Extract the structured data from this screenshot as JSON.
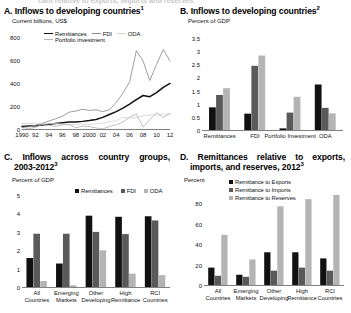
{
  "figure": {
    "cut_off_header": "cant relative to exports, imports and reserves"
  },
  "panels": {
    "a": {
      "title": "A. Inflows to developing countries",
      "title_sup": "1",
      "axis_label": "Current billions, US$",
      "legend": [
        "Remittances",
        "FDI",
        "ODA",
        "Portfolio investment"
      ],
      "yticks": [
        "0",
        "200",
        "400",
        "600",
        "800"
      ],
      "xticks": [
        "1990",
        "92",
        "94",
        "96",
        "98",
        "2000",
        "02",
        "04",
        "06",
        "08",
        "10",
        "12"
      ]
    },
    "b": {
      "title": "B. Inflows to developing countries",
      "title_sup": "2",
      "axis_label": "Percent of GDP",
      "legend": [
        "1990",
        "2000",
        "2010"
      ],
      "yticks": [
        "0",
        "0.5",
        "1",
        "1.5",
        "2",
        "2.5",
        "3",
        "3.5"
      ],
      "categories": [
        "Remittances",
        "FDI",
        "Portfolio Investment",
        "ODA"
      ]
    },
    "c": {
      "title": "C. Inflows across country groups,",
      "title_line2": "2003-2012",
      "title_sup": "3",
      "axis_label": "Percent of GDP",
      "legend": [
        "Remittances",
        "FDI",
        "ODA"
      ],
      "yticks": [
        "0",
        "1",
        "2",
        "3",
        "4",
        "5"
      ],
      "categories": [
        "All Countries",
        "Emerging Markets",
        "Other Developing",
        "High Remittance",
        "RCI Countries"
      ]
    },
    "d": {
      "title": "D. Remittances relative to exports,",
      "title_line2": "imports, and reserves, 2012",
      "title_sup": "3",
      "axis_label": "Percent",
      "legend": [
        "Remittance to Exports",
        "Remittance to Imports",
        "Remittance to Reserves"
      ],
      "yticks": [
        "0",
        "20",
        "40",
        "60",
        "80"
      ],
      "categories": [
        "All Countries",
        "Emerging Markets",
        "Other Developing",
        "High Remittance",
        "RCI Countries"
      ]
    }
  },
  "colors": {
    "black": "#111111",
    "dark_gray": "#5a5a5a",
    "light_gray": "#b4b4b4",
    "mid_gray": "#8c8c8c",
    "pale_gray": "#d2d2d2",
    "axis": "#808080"
  },
  "chart_data": [
    {
      "type": "line",
      "panel": "A",
      "title": "A. Inflows to developing countries",
      "ylabel": "Current billions, US$",
      "xlabel": "",
      "ylim": [
        0,
        800
      ],
      "grid": false,
      "legend_position": "top",
      "x": [
        1990,
        1991,
        1992,
        1993,
        1994,
        1995,
        1996,
        1997,
        1998,
        1999,
        2000,
        2001,
        2002,
        2003,
        2004,
        2005,
        2006,
        2007,
        2008,
        2009,
        2010,
        2011,
        2012
      ],
      "series": [
        {
          "name": "Remittances",
          "color": "#111111",
          "values": [
            30,
            34,
            38,
            44,
            50,
            56,
            62,
            69,
            70,
            75,
            82,
            92,
            110,
            135,
            160,
            190,
            225,
            265,
            300,
            290,
            325,
            370,
            405
          ]
        },
        {
          "name": "FDI",
          "color": "#8c8c8c",
          "values": [
            22,
            28,
            40,
            58,
            78,
            98,
            120,
            155,
            165,
            180,
            170,
            175,
            160,
            175,
            240,
            320,
            420,
            690,
            600,
            430,
            570,
            700,
            600
          ]
        },
        {
          "name": "ODA",
          "color": "#d2d2d2",
          "values": [
            55,
            58,
            58,
            54,
            58,
            56,
            50,
            45,
            48,
            52,
            50,
            54,
            60,
            72,
            80,
            110,
            105,
            105,
            125,
            130,
            130,
            140,
            135
          ]
        },
        {
          "name": "Portfolio investment",
          "color": "#b4b4b4",
          "values": [
            5,
            12,
            22,
            50,
            42,
            30,
            45,
            50,
            20,
            35,
            30,
            18,
            10,
            30,
            45,
            70,
            110,
            140,
            25,
            90,
            150,
            110,
            145
          ]
        }
      ]
    },
    {
      "type": "bar",
      "panel": "B",
      "title": "B. Inflows to developing countries",
      "ylabel": "Percent of GDP",
      "ylim": [
        0,
        3.5
      ],
      "grid": false,
      "legend_position": "top-right",
      "categories": [
        "Remittances",
        "FDI",
        "Portfolio Investment",
        "ODA"
      ],
      "series": [
        {
          "name": "1990",
          "color": "#111111",
          "values": [
            0.9,
            0.66,
            0.1,
            1.77
          ]
        },
        {
          "name": "2000",
          "color": "#5a5a5a",
          "values": [
            1.37,
            2.48,
            0.7,
            0.88
          ]
        },
        {
          "name": "2010",
          "color": "#b4b4b4",
          "values": [
            1.63,
            2.87,
            1.3,
            0.67
          ]
        }
      ]
    },
    {
      "type": "bar",
      "panel": "C",
      "title": "C. Inflows across country groups, 2003-2012",
      "ylabel": "Percent of GDP",
      "ylim": [
        0,
        5
      ],
      "grid": false,
      "legend_position": "top-right",
      "categories": [
        "All Countries",
        "Emerging Markets",
        "Other Developing",
        "High Remittance",
        "RCI Countries"
      ],
      "series": [
        {
          "name": "Remittances",
          "color": "#111111",
          "values": [
            1.63,
            1.33,
            3.93,
            3.87,
            3.9
          ]
        },
        {
          "name": "FDI",
          "color": "#5a5a5a",
          "values": [
            2.95,
            2.95,
            3.05,
            2.93,
            3.67
          ]
        },
        {
          "name": "ODA",
          "color": "#b4b4b4",
          "values": [
            0.38,
            0.15,
            2.05,
            0.78,
            0.7
          ]
        }
      ]
    },
    {
      "type": "bar",
      "panel": "D",
      "title": "D. Remittances relative to exports, imports, and reserves, 2012",
      "ylabel": "Percent",
      "ylim": [
        0,
        90
      ],
      "grid": false,
      "legend_position": "top-right",
      "categories": [
        "All Countries",
        "Emerging Markets",
        "Other Developing",
        "High Remittance",
        "RCI Countries"
      ],
      "series": [
        {
          "name": "Remittance to Exports",
          "color": "#111111",
          "values": [
            18,
            11,
            33,
            33,
            27
          ]
        },
        {
          "name": "Remittance to Imports",
          "color": "#5a5a5a",
          "values": [
            10,
            9,
            15,
            18,
            15
          ]
        },
        {
          "name": "Remittance to Reserves",
          "color": "#b4b4b4",
          "values": [
            50,
            26,
            78,
            85,
            89
          ]
        }
      ]
    }
  ]
}
